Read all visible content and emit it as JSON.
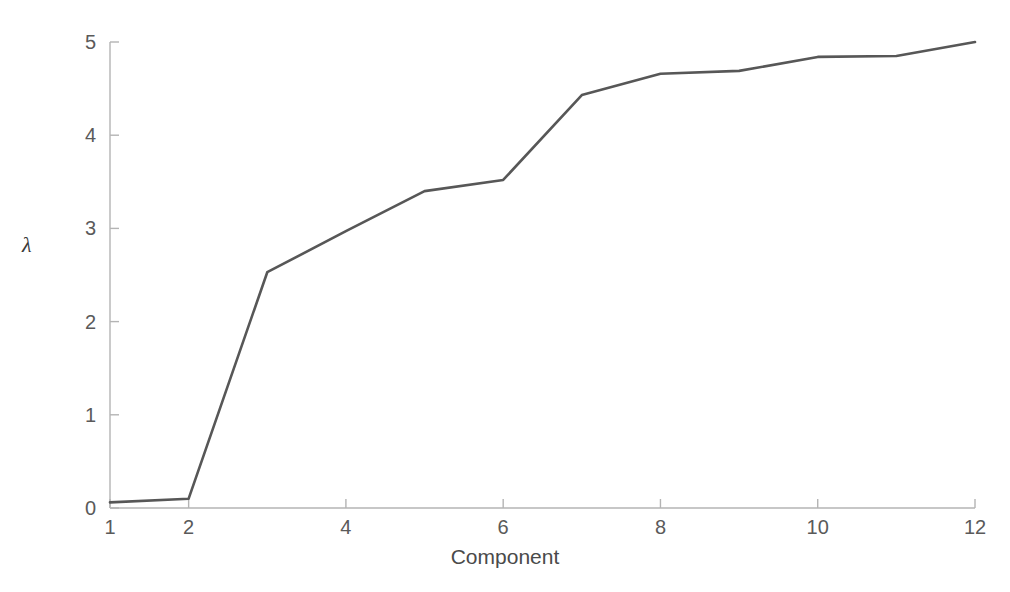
{
  "chart_data": {
    "type": "line",
    "title": "",
    "subtitle": "",
    "xlabel": "Component",
    "ylabel": "λ",
    "x": [
      1,
      2,
      3,
      4,
      5,
      6,
      7,
      8,
      9,
      10,
      11,
      12
    ],
    "values": [
      0.06,
      0.1,
      2.53,
      2.97,
      3.4,
      3.52,
      4.43,
      4.66,
      4.69,
      4.84,
      4.85,
      5.0
    ],
    "series": [
      {
        "name": "eigenvalue",
        "values": [
          0.06,
          0.1,
          2.53,
          2.97,
          3.4,
          3.52,
          4.43,
          4.66,
          4.69,
          4.84,
          4.85,
          5.0
        ]
      }
    ],
    "xlim": [
      1,
      12
    ],
    "ylim": [
      0,
      5
    ],
    "xticks": [
      1,
      2,
      4,
      6,
      8,
      10,
      12
    ],
    "xtick_labels": [
      "1",
      "2",
      "4",
      "6",
      "8",
      "10",
      "12"
    ],
    "yticks": [
      0,
      1,
      2,
      3,
      4,
      5
    ],
    "ytick_labels": [
      "0",
      "1",
      "2",
      "3",
      "4",
      "5"
    ],
    "grid": false,
    "legend": false,
    "legend_position": "none",
    "line_color": "#575757",
    "axis_color": "#b4b4b4",
    "text_color": "#5a5a5a",
    "background_color": "#ffffff",
    "annotations": []
  },
  "geometry": {
    "plot_left": 110,
    "plot_right": 975,
    "plot_top": 42,
    "plot_bottom": 508
  }
}
